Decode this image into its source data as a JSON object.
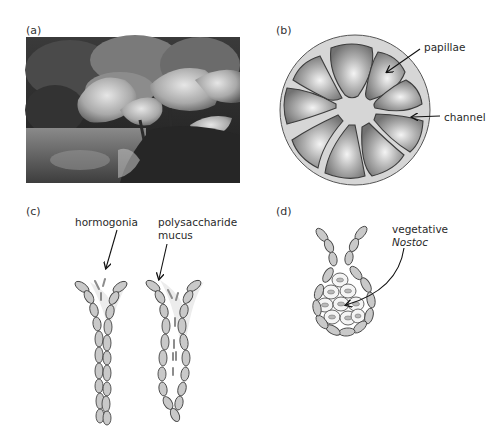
{
  "figure": {
    "panels": [
      {
        "id": "a",
        "label": "(a)",
        "content": "photograph of large-leaved Gunnera plants beside a pond"
      },
      {
        "id": "b",
        "label": "(b)",
        "content": "cross-section of gland showing papillae and channel",
        "annotations": [
          "papillae",
          "channel"
        ]
      },
      {
        "id": "c",
        "label": "(c)",
        "content": "filaments releasing hormogonia into polysaccharide mucus",
        "annotations": [
          "hormogonia",
          "polysaccharide",
          "mucus"
        ]
      },
      {
        "id": "d",
        "label": "(d)",
        "content": "gland cells containing vegetative Nostoc",
        "annotations": [
          "vegetative",
          "Nostoc"
        ]
      }
    ]
  },
  "colors": {
    "cell_fill": "#c8c8c8",
    "cell_stroke": "#444444",
    "circle_fill": "#d9d9d9",
    "papilla_dark": "#7a7a7a",
    "papilla_light": "#f2f2f2",
    "arrow": "#111111"
  }
}
